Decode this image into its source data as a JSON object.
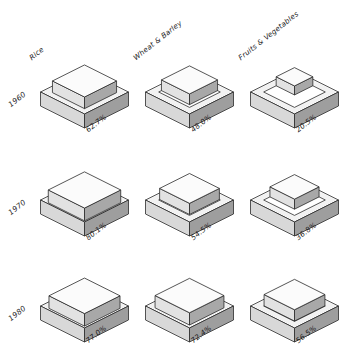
{
  "chart_data": {
    "type": "bar",
    "title": "",
    "subtitle": "",
    "xlabel": "",
    "ylabel": "",
    "grid": false,
    "legend_position": "none",
    "axis_note": "Isometric nested-box small multiples; inner cube footprint encodes the percentage value.",
    "categories": [
      "Rice",
      "Wheat & Barley",
      "Fruits & Vegetables"
    ],
    "rows": [
      "1960",
      "1970",
      "1980"
    ],
    "ylim": [
      0,
      100
    ],
    "value_suffix": "%",
    "series": [
      {
        "name": "1960",
        "values": [
          62.7,
          48.0,
          20.5
        ]
      },
      {
        "name": "1970",
        "values": [
          80.1,
          54.5,
          36.8
        ]
      },
      {
        "name": "1980",
        "values": [
          77.0,
          72.4,
          56.5
        ]
      }
    ],
    "cells": [
      {
        "row": "1960",
        "category": "Rice",
        "value": 62.7,
        "label": "62.7%"
      },
      {
        "row": "1960",
        "category": "Wheat & Barley",
        "value": 48.0,
        "label": "48.0%"
      },
      {
        "row": "1960",
        "category": "Fruits & Vegetables",
        "value": 20.5,
        "label": "20.5%"
      },
      {
        "row": "1970",
        "category": "Rice",
        "value": 80.1,
        "label": "80.1%"
      },
      {
        "row": "1970",
        "category": "Wheat & Barley",
        "value": 54.5,
        "label": "54.5%"
      },
      {
        "row": "1970",
        "category": "Fruits & Vegetables",
        "value": 36.8,
        "label": "36.8%"
      },
      {
        "row": "1980",
        "category": "Rice",
        "value": 77.0,
        "label": "77.0%"
      },
      {
        "row": "1980",
        "category": "Wheat & Barley",
        "value": 72.4,
        "label": "72.4%"
      },
      {
        "row": "1980",
        "category": "Fruits & Vegetables",
        "value": 56.5,
        "label": "56.5%"
      }
    ],
    "colors": {
      "outline": "#2b2b2b",
      "top_face": "#f2f2f2",
      "left_face": "#d8d8d8",
      "right_face": "#9e9e9e",
      "inner_top": "#fbfbfb",
      "inner_left": "#e2e2e2",
      "inner_right": "#a8a8a8",
      "background": "#ffffff"
    }
  },
  "headers": {
    "col_0": "Rice",
    "col_1": "Wheat & Barley",
    "col_2": "Fruits & Vegetables"
  },
  "row_labels": {
    "row_0": "1960",
    "row_1": "1970",
    "row_2": "1980"
  },
  "values": {
    "v00": "62.7%",
    "v01": "48.0%",
    "v02": "20.5%",
    "v10": "80.1%",
    "v11": "54.5%",
    "v12": "36.8%",
    "v20": "77.0%",
    "v21": "72.4%",
    "v22": "56.5%"
  }
}
